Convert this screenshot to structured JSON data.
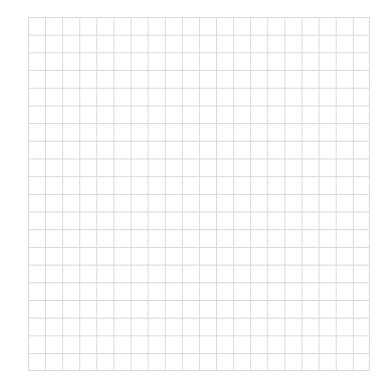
{
  "grid": {
    "columns": 20,
    "rows": 20,
    "line_color": "#d9d9d9",
    "background_color": "#ffffff"
  }
}
